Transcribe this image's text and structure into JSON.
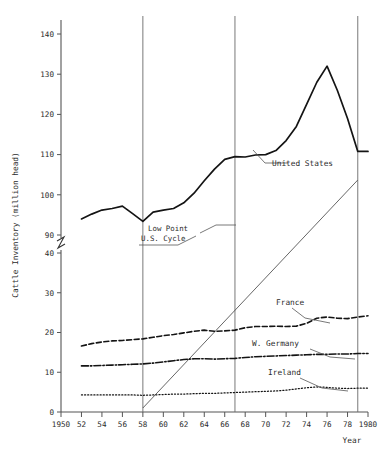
{
  "chart_data": {
    "type": "line",
    "title": "",
    "xlabel": "Year",
    "ylabel": "Cattle Inventory (million head)",
    "xlim": [
      1950,
      1980
    ],
    "ylim_lower": [
      0,
      40
    ],
    "ylim_upper": [
      90,
      140
    ],
    "axis_break": true,
    "grid": false,
    "legend_position": "inline-labels",
    "yticks_lower": [
      "0",
      "10",
      "20",
      "30",
      "40"
    ],
    "yticks_upper": [
      "90",
      "100",
      "110",
      "120",
      "130",
      "140"
    ],
    "xticks": [
      "1950",
      "52",
      "54",
      "56",
      "58",
      "60",
      "62",
      "64",
      "66",
      "68",
      "70",
      "72",
      "74",
      "76",
      "78",
      "1980"
    ],
    "xtick_values": [
      1950,
      1952,
      1954,
      1956,
      1958,
      1960,
      1962,
      1964,
      1966,
      1968,
      1970,
      1972,
      1974,
      1976,
      1978,
      1980
    ],
    "x": [
      1952,
      1953,
      1954,
      1955,
      1956,
      1957,
      1958,
      1959,
      1960,
      1961,
      1962,
      1963,
      1964,
      1965,
      1966,
      1967,
      1968,
      1969,
      1970,
      1971,
      1972,
      1973,
      1974,
      1975,
      1976,
      1977,
      1978,
      1979
    ],
    "series": [
      {
        "name": "United States",
        "style": "solid",
        "values": [
          94.0,
          95.2,
          96.2,
          96.6,
          97.2,
          95.3,
          93.4,
          95.7,
          96.2,
          96.6,
          98.0,
          100.4,
          103.5,
          106.4,
          108.8,
          109.5,
          109.4,
          109.9,
          110.0,
          111.0,
          113.5,
          117.0,
          122.5,
          128.0,
          132.0,
          126.0,
          119.0,
          110.8
        ],
        "label_text": "United States",
        "endpoint_flat": true
      },
      {
        "name": "France",
        "style": "dashed",
        "values": [
          16.6,
          17.2,
          17.6,
          17.9,
          18.0,
          18.2,
          18.4,
          18.8,
          19.2,
          19.5,
          19.9,
          20.3,
          20.6,
          20.3,
          20.4,
          20.6,
          21.2,
          21.5,
          21.5,
          21.6,
          21.5,
          21.6,
          22.3,
          23.6,
          23.9,
          23.6,
          23.5,
          23.9
        ],
        "label_text": "France",
        "end_value": 24.2
      },
      {
        "name": "W. Germany",
        "style": "dash-dot",
        "values": [
          11.6,
          11.6,
          11.7,
          11.8,
          11.9,
          12.0,
          12.1,
          12.3,
          12.6,
          12.9,
          13.2,
          13.4,
          13.4,
          13.3,
          13.4,
          13.5,
          13.7,
          13.9,
          14.0,
          14.1,
          14.2,
          14.3,
          14.4,
          14.5,
          14.5,
          14.6,
          14.6,
          14.7
        ],
        "label_text": "W. Germany",
        "end_value": 14.7
      },
      {
        "name": "Ireland",
        "style": "dotted",
        "values": [
          4.3,
          4.3,
          4.3,
          4.3,
          4.3,
          4.3,
          4.2,
          4.3,
          4.4,
          4.5,
          4.5,
          4.6,
          4.7,
          4.7,
          4.8,
          4.9,
          5.0,
          5.1,
          5.2,
          5.3,
          5.5,
          5.8,
          6.1,
          6.3,
          6.2,
          6.0,
          5.9,
          6.0
        ],
        "label_text": "Ireland",
        "end_value": 6.0
      }
    ],
    "annotations": [
      {
        "name": "low-point-us-cycle",
        "line1": "Low Point",
        "line2": "U.S. Cycle"
      }
    ],
    "reference_lines": [
      {
        "name": "cycle-line-1958",
        "year": 1958
      },
      {
        "name": "cycle-line-1967",
        "year": 1967
      },
      {
        "name": "cycle-line-1979",
        "year": 1979
      }
    ],
    "trend_line": {
      "name": "cycle-trend-line"
    }
  },
  "axis": {
    "y_title": "Cattle Inventory (million head)",
    "x_title": "Year"
  }
}
